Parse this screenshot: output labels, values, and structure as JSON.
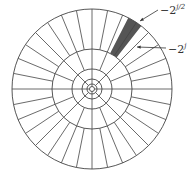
{
  "diagram": {
    "center": [
      92,
      89
    ],
    "rings": [
      80,
      40,
      20,
      10,
      5,
      2.5
    ],
    "spokes_per_annulus": [
      32,
      16,
      8,
      8,
      4
    ],
    "highlight": {
      "annulus": 0,
      "wedge_start_deg": 52,
      "wedge_end_deg": 63,
      "color": "#555555"
    },
    "line_color": "#444444",
    "labels": [
      {
        "base": "−2",
        "exp": "j/2"
      },
      {
        "base": "−2",
        "exp": "j"
      }
    ]
  }
}
